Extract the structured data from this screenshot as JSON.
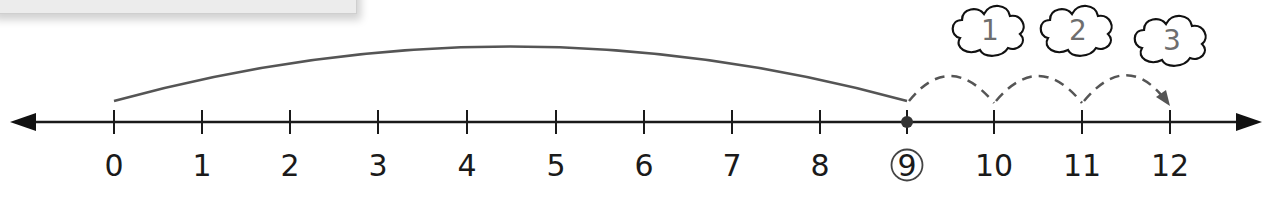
{
  "diagram": {
    "type": "number-line",
    "ticks": [
      {
        "value": 0,
        "label": "0",
        "x": 114
      },
      {
        "value": 1,
        "label": "1",
        "x": 202
      },
      {
        "value": 2,
        "label": "2",
        "x": 290
      },
      {
        "value": 3,
        "label": "3",
        "x": 378
      },
      {
        "value": 4,
        "label": "4",
        "x": 467
      },
      {
        "value": 5,
        "label": "5",
        "x": 556
      },
      {
        "value": 6,
        "label": "6",
        "x": 644
      },
      {
        "value": 7,
        "label": "7",
        "x": 732
      },
      {
        "value": 8,
        "label": "8",
        "x": 820
      },
      {
        "value": 9,
        "label": "9",
        "x": 907,
        "circled": true,
        "point": true
      },
      {
        "value": 10,
        "label": "10",
        "x": 994
      },
      {
        "value": 11,
        "label": "11",
        "x": 1082
      },
      {
        "value": 12,
        "label": "12",
        "x": 1170
      }
    ],
    "big_jump": {
      "from": 0,
      "to": 9
    },
    "hops": [
      {
        "from": 9,
        "to": 10,
        "count_label": "1"
      },
      {
        "from": 10,
        "to": 11,
        "count_label": "2"
      },
      {
        "from": 11,
        "to": 12,
        "count_label": "3"
      }
    ],
    "colors": {
      "axis": "#1a1a1a",
      "arc": "#555555",
      "dashed": "#555555",
      "cloud_text": "#6e6e6e",
      "panel": "#ececec"
    }
  }
}
